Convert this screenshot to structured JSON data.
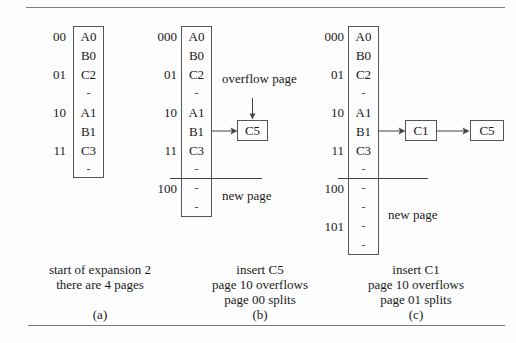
{
  "figure": {
    "panels": [
      {
        "id": "a",
        "buckets": [
          "00",
          "01",
          "10",
          "11"
        ],
        "slots": [
          "A0",
          "B0",
          "C2",
          "-",
          "A1",
          "B1",
          "C3",
          "-"
        ],
        "overflow_chain": [],
        "new_page_label": "",
        "annotation": "",
        "caption_lines": [
          "start of expansion 2",
          "there are 4 pages"
        ],
        "sublabel": "(a)"
      },
      {
        "id": "b",
        "buckets": [
          "000",
          "01",
          "10",
          "11",
          "100"
        ],
        "slots": [
          "A0",
          "B0",
          "C2",
          "-",
          "A1",
          "B1",
          "C3",
          "-",
          "-",
          "-"
        ],
        "overflow_chain": [
          "C5"
        ],
        "new_page_label": "new page",
        "annotation": "overflow page",
        "annotation_line1": "overflow",
        "annotation_line2": "page",
        "caption_lines": [
          "insert C5",
          "page 10 overflows",
          "page 00 splits"
        ],
        "sublabel": "(b)"
      },
      {
        "id": "c",
        "buckets": [
          "000",
          "01",
          "10",
          "11",
          "100",
          "101"
        ],
        "slots": [
          "A0",
          "B0",
          "C2",
          "-",
          "A1",
          "B1",
          "C3",
          "-",
          "-",
          "-",
          "-",
          "-"
        ],
        "overflow_chain": [
          "C1",
          "C5"
        ],
        "new_page_label": "new page",
        "annotation": "",
        "caption_lines": [
          "insert C1",
          "page 10 overflows",
          "page 01 splits"
        ],
        "sublabel": "(c)"
      }
    ]
  }
}
